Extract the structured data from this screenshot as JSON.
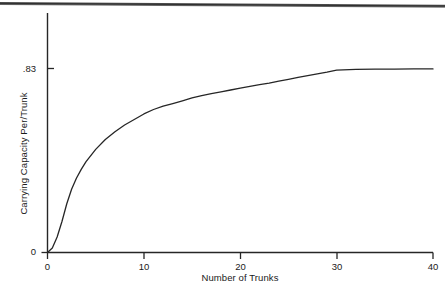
{
  "figure": {
    "scan_artifact": "page-edge-line",
    "background_color": "#ffffff",
    "line_color": "#262626"
  },
  "chart_data": {
    "type": "line",
    "title": "",
    "xlabel": "Number of Trunks",
    "ylabel": "Carrying Capacity Per/Trunk",
    "xlim": [
      0,
      40
    ],
    "ylim": [
      0,
      0.92
    ],
    "grid": false,
    "legend": null,
    "xticks": [
      0,
      10,
      20,
      30,
      40
    ],
    "xtick_labels": [
      "0",
      "10",
      "20",
      "30",
      "40"
    ],
    "yticks": [
      0,
      0.83
    ],
    "ytick_labels": [
      "0",
      ".83"
    ],
    "asymptote": 0.83,
    "series": [
      {
        "name": "Carrying Capacity Per/Trunk",
        "x": [
          0,
          0.5,
          1,
          1.5,
          2,
          2.5,
          3,
          3.5,
          4,
          5,
          6,
          7,
          8,
          9,
          10,
          11,
          12,
          13,
          14,
          15,
          16,
          17,
          18,
          19,
          20,
          21,
          22,
          23,
          24,
          25,
          26,
          27,
          28,
          29,
          30,
          32,
          34,
          36,
          38,
          40
        ],
        "values": [
          0,
          0.02,
          0.07,
          0.14,
          0.22,
          0.285,
          0.335,
          0.375,
          0.41,
          0.465,
          0.51,
          0.545,
          0.575,
          0.6,
          0.625,
          0.645,
          0.66,
          0.672,
          0.684,
          0.697,
          0.708,
          0.717,
          0.725,
          0.733,
          0.741,
          0.749,
          0.757,
          0.764,
          0.773,
          0.781,
          0.79,
          0.798,
          0.806,
          0.814,
          0.823,
          0.826,
          0.827,
          0.827,
          0.828,
          0.828
        ]
      }
    ]
  }
}
